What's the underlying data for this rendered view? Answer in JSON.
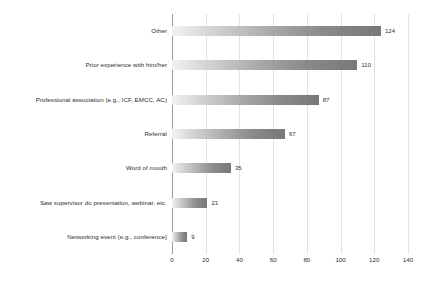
{
  "chart_data": {
    "type": "bar",
    "orientation": "horizontal",
    "title": "",
    "xlabel": "",
    "ylabel": "",
    "xlim": [
      0,
      140
    ],
    "xticks": [
      0,
      20,
      40,
      60,
      80,
      100,
      120,
      140
    ],
    "grid": true,
    "legend": false,
    "categories": [
      "Other",
      "Prior experience with him/her",
      "Professional association (e.g., ICF, EMCC, AC)",
      "Referral",
      "Word of mouth",
      "Saw supervisor do presentation, webinar, etc.",
      "Networking event (e.g., conference)"
    ],
    "values": [
      124,
      110,
      87,
      67,
      35,
      21,
      9
    ],
    "value_labels": [
      "124",
      "110",
      "87",
      "67",
      "35",
      "21",
      "9"
    ],
    "tick_labels": [
      "0",
      "20",
      "40",
      "60",
      "80",
      "100",
      "120",
      "140"
    ],
    "colors": {
      "bar_gradient_start": "#f2f2f2",
      "bar_gradient_end": "#787878",
      "gridline": "#e2e2e2",
      "axis_line": "#9a9a9a",
      "text": "#2b2b2b",
      "background": "#ffffff"
    }
  }
}
